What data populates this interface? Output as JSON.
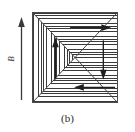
{
  "figure": {
    "caption": "(b)",
    "field_label": "B",
    "colors": {
      "ink": "#3a3a3a",
      "border": "#4a4a4a",
      "background": "#ffffff",
      "fill": "#f2f2f2"
    }
  },
  "field_arrow": {
    "name": "external-field-arrow",
    "direction": "up",
    "label": "B"
  },
  "domains": [
    {
      "id": "left",
      "position": "left-triangle",
      "hatching": "vertical",
      "magnetization": "up",
      "arrow_name": "magnetization-arrow-up"
    },
    {
      "id": "top",
      "position": "top-triangle",
      "hatching": "horizontal",
      "magnetization": "right",
      "arrow_name": "magnetization-arrow-right"
    },
    {
      "id": "right",
      "position": "right-triangle",
      "hatching": "horizontal",
      "magnetization": "down",
      "arrow_name": "magnetization-arrow-down"
    },
    {
      "id": "bottom",
      "position": "bottom-triangle",
      "hatching": "horizontal",
      "magnetization": "left",
      "arrow_name": "magnetization-arrow-left"
    }
  ]
}
